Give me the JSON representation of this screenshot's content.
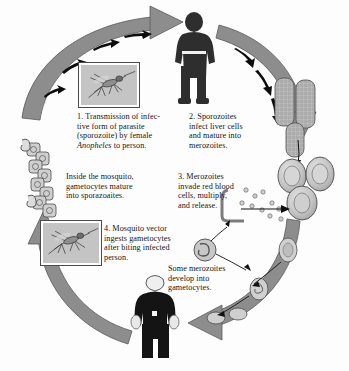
{
  "figure": {
    "type": "cycle-diagram",
    "background_color": "#fdfdfd",
    "arrow_color": "#8d8d8d",
    "arrow_outline_color": "#55565a",
    "arrow_marker_color": "#111111",
    "cell_fill_color": "#c9c9c9",
    "cell_outline_color": "#4b4b4b",
    "figure_color": "#2b2b2b"
  },
  "steps": [
    {
      "id": "step-1",
      "number": "1.",
      "lines": [
        "1. Transmission of infec-",
        "tive form of parasite",
        "(sporozoite) by female",
        "Anopheles to person."
      ],
      "italic_term": "Anopheles"
    },
    {
      "id": "step-2",
      "number": "2.",
      "lines": [
        "2. Sporozoites",
        "infect liver cells",
        "and mature into",
        "merozoites."
      ]
    },
    {
      "id": "step-3",
      "number": "3.",
      "lines": [
        "3. Merozoites",
        "invade red blood",
        "cells, multiply,",
        "and release."
      ]
    },
    {
      "id": "step-4",
      "number": "4.",
      "lines": [
        "4. Mosquito vector",
        "ingests gametocytes",
        "after biting infected",
        "person."
      ]
    }
  ],
  "notes": [
    {
      "id": "note-mosquito-interior",
      "lines": [
        "Inside the mosquito,",
        "gametocytes mature",
        "into sporazoaites."
      ]
    },
    {
      "id": "note-gametocytes",
      "lines": [
        "Some merozoites",
        "develop into",
        "gametocytes."
      ]
    }
  ],
  "illustrations": [
    {
      "id": "mosquito-photo-top",
      "label": "mosquito photograph"
    },
    {
      "id": "mosquito-photo-bottom",
      "label": "mosquito photograph"
    },
    {
      "id": "person-standing-top",
      "label": "human figure silhouette"
    },
    {
      "id": "person-standing-bottom",
      "label": "human figure silhouette"
    },
    {
      "id": "liver-cells",
      "label": "hatched liver cells"
    },
    {
      "id": "red-blood-cells",
      "label": "red blood cells with merozoites"
    },
    {
      "id": "gametocyte-chain",
      "label": "gametocyte cell chain"
    }
  ],
  "bottom_caption": " "
}
